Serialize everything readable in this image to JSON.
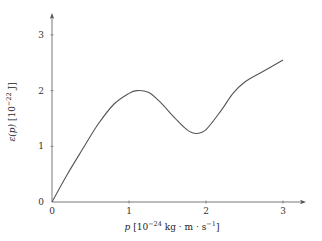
{
  "chart_data": {
    "type": "line",
    "title": "",
    "xlabel": "p [10^-24 kg · m · s^-1]",
    "ylabel": "ε(p) [10^-22 J]",
    "xlim": [
      0,
      3.3
    ],
    "ylim": [
      0,
      3.5
    ],
    "x_ticks": [
      0,
      1,
      2,
      3
    ],
    "y_ticks": [
      0,
      1,
      2,
      3
    ],
    "x_tick_labels": [
      "0",
      "1",
      "2",
      "3"
    ],
    "y_tick_labels": [
      "0",
      "1",
      "2",
      "3"
    ],
    "grid": false,
    "legend": null,
    "series": [
      {
        "name": "ε(p)",
        "color": "#555555",
        "x": [
          0,
          0.2,
          0.42,
          0.6,
          0.8,
          1.0,
          1.1,
          1.25,
          1.4,
          1.6,
          1.75,
          1.87,
          2.0,
          2.2,
          2.35,
          2.5,
          2.75,
          3.0
        ],
        "y": [
          0,
          0.5,
          1.0,
          1.4,
          1.75,
          1.95,
          2.0,
          1.97,
          1.8,
          1.5,
          1.3,
          1.23,
          1.3,
          1.65,
          1.95,
          2.15,
          2.35,
          2.55
        ]
      }
    ]
  },
  "labels": {
    "x_var": "p",
    "x_unit_open": " [10",
    "x_exp": "−24",
    "x_unit_mid": " kg · m · s",
    "x_exp2": "−1",
    "x_unit_close": "]",
    "y_var": "ε(p)",
    "y_unit_open": " [10",
    "y_exp": "−22",
    "y_unit_close": " J]"
  }
}
